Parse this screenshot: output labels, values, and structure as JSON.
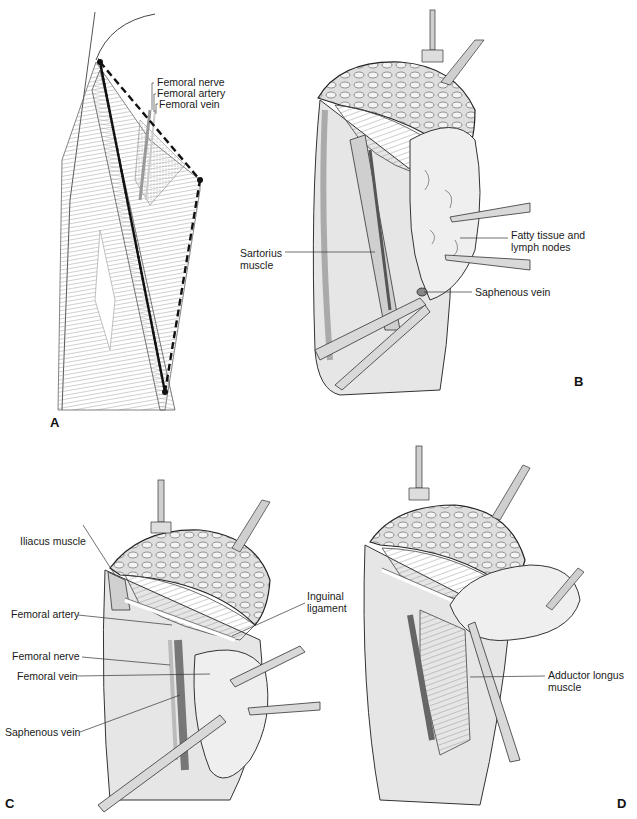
{
  "figure": {
    "panels": [
      {
        "id": "A",
        "letter": "A",
        "labels": [
          "Femoral nerve",
          "Femoral artery",
          "Femoral vein"
        ]
      },
      {
        "id": "B",
        "letter": "B",
        "labels": [
          "Sartorius muscle",
          "Fatty tissue and lymph nodes",
          "Saphenous vein"
        ]
      },
      {
        "id": "C",
        "letter": "C",
        "labels": [
          "Iliacus muscle",
          "Femoral artery",
          "Inguinal ligament",
          "Femoral nerve",
          "Femoral vein",
          "Saphenous vein"
        ]
      },
      {
        "id": "D",
        "letter": "D",
        "labels": [
          "Adductor longus muscle"
        ]
      }
    ]
  },
  "panelA": {
    "letter": "A",
    "femoral_nerve": "Femoral nerve",
    "femoral_artery": "Femoral artery",
    "femoral_vein": "Femoral vein"
  },
  "panelB": {
    "letter": "B",
    "sartorius": "Sartorius muscle",
    "fatty_tissue": "Fatty tissue and lymph nodes",
    "saphenous_vein": "Saphenous vein"
  },
  "panelC": {
    "letter": "C",
    "iliacus": "Iliacus muscle",
    "femoral_artery": "Femoral artery",
    "inguinal_ligament": "Inguinal ligament",
    "femoral_nerve": "Femoral nerve",
    "femoral_vein": "Femoral vein",
    "saphenous_vein": "Saphenous vein"
  },
  "panelD": {
    "letter": "D",
    "adductor_longus": "Adductor longus muscle"
  }
}
